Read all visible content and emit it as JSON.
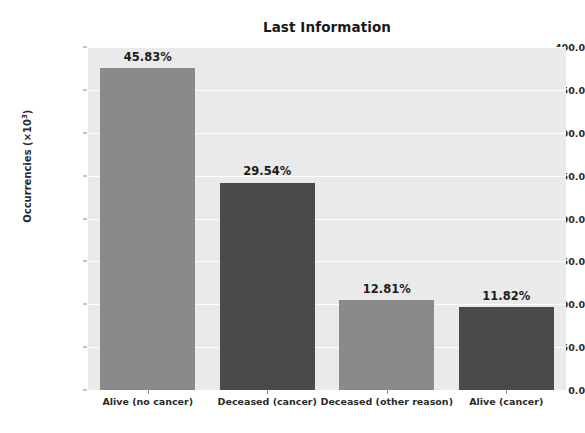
{
  "chart_data": {
    "type": "bar",
    "title": "Last Information",
    "xlabel": "",
    "ylabel": "Occurrencies (×10³)",
    "ylabel_text": "Occurrencies (×10",
    "ylabel_exponent": "3",
    "ylabel_suffix": ")",
    "categories": [
      "Alive (no cancer)",
      "Deceased (cancer)",
      "Deceased (other reason)",
      "Alive (cancer)"
    ],
    "values": [
      376.0,
      242.0,
      105.0,
      97.0
    ],
    "data_labels": [
      "45.83%",
      "29.54%",
      "12.81%",
      "11.82%"
    ],
    "bar_colors": [
      "#8a8a8a",
      "#4a4a4a",
      "#8a8a8a",
      "#4a4a4a"
    ],
    "ylim": [
      0,
      400
    ],
    "ytick_values": [
      0.0,
      50.0,
      100.0,
      150.0,
      200.0,
      250.0,
      300.0,
      350.0,
      400.0
    ],
    "ytick_labels": [
      "0.0",
      "50.0",
      "100.0",
      "150.0",
      "200.0",
      "250.0",
      "300.0",
      "350.0",
      "400.0"
    ],
    "grid": true,
    "grid_axis": "y",
    "grid_color": "#fdfdfd",
    "legend": null,
    "legend_position": "none",
    "plot_background": "#eaeaea",
    "figure_background": "#ffffff"
  }
}
